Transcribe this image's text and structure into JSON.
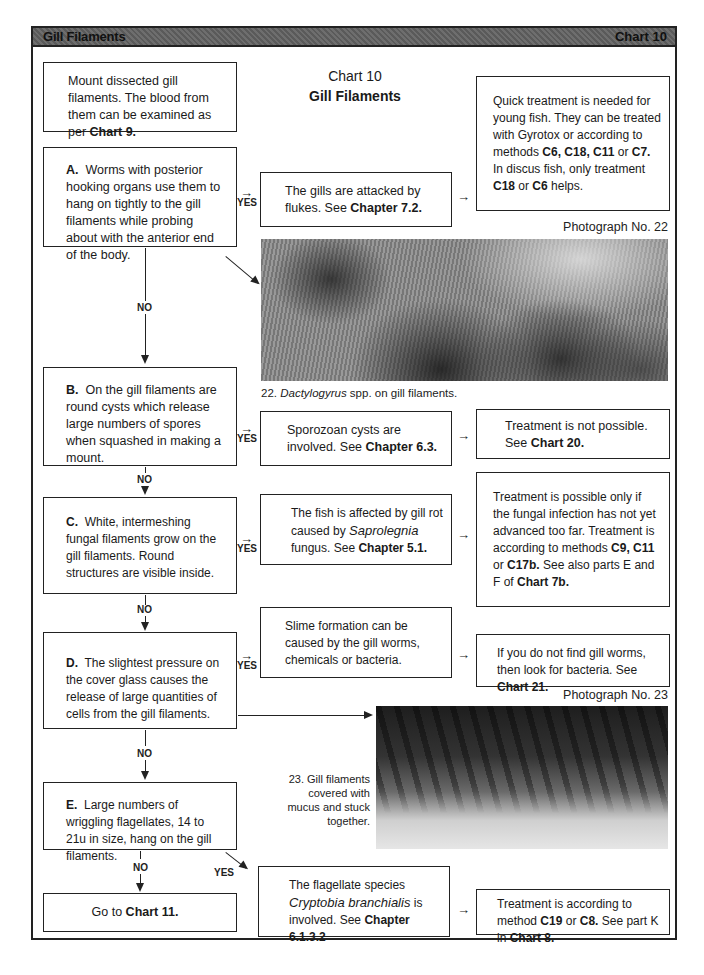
{
  "header": {
    "title": "Gill Filaments",
    "chart_label": "Chart 10"
  },
  "chart_heading": {
    "line1": "Chart 10",
    "line2": "Gill Filaments"
  },
  "intro_box": {
    "text_before": "Mount dissected gill filaments. The blood from them can be examined as per ",
    "ref": "Chart 9."
  },
  "labels": {
    "yes": "YES",
    "no": "NO",
    "arrow": "→"
  },
  "steps": [
    {
      "letter": "A.",
      "question": "Worms with posterior hooking organs use them to hang on tightly to the gill filaments while probing about with the anterior end of the body.",
      "yes_result": {
        "text": "The gills are attacked by flukes. See ",
        "ref": "Chapter 7.2."
      },
      "treatment": {
        "t1": "Quick treatment is needed for young fish. They can be treated with Gyrotox or according to methods ",
        "r1": "C6, C18, C11",
        "t2": " or ",
        "r2": "C7.",
        "t3": " In discus fish, only treatment ",
        "r3": "C18",
        "t4": " or ",
        "r4": "C6",
        "t5": " helps."
      }
    },
    {
      "letter": "B.",
      "question": "On the gill filaments are round cysts which release large numbers of spores when squashed in making a mount.",
      "yes_result": {
        "text": "Sporozoan cysts are involved. See ",
        "ref": "Chapter 6.3."
      },
      "treatment": {
        "t1": "Treatment is not possible. See ",
        "r1": "Chart 20."
      }
    },
    {
      "letter": "C.",
      "question": "White, intermeshing fungal filaments grow on the gill filaments. Round structures are visible inside.",
      "yes_result": {
        "t1": "The fish is affected by gill rot caused by ",
        "italic": "Saprolegnia",
        "t2": " fungus. See ",
        "ref": "Chapter 5.1."
      },
      "treatment": {
        "t1": "Treatment is possible only if the fungal infection has not yet advanced too far. Treatment is according to methods ",
        "r1": "C9, C11",
        "t2": " or ",
        "r2": "C17b.",
        "t3": " See also parts E and F of ",
        "r3": "Chart 7b."
      }
    },
    {
      "letter": "D.",
      "question": "The slightest pressure on the cover glass causes the release of large quantities of cells from the gill filaments.",
      "yes_result": {
        "text": "Slime formation can be caused by the gill worms, chemicals or bacteria."
      },
      "treatment": {
        "t1": "If you do not find gill worms, then look for bacteria. See ",
        "r1": "Chart 21."
      }
    },
    {
      "letter": "E.",
      "question": "Large numbers of wriggling flagellates, 14 to 21u in size, hang on the gill filaments.",
      "yes_result": {
        "t1": "The flagellate species ",
        "italic": "Cryptobia branchialis",
        "t2": " is involved. See ",
        "ref": "Chapter 6.1.3.2"
      },
      "treatment": {
        "r1": "C19",
        "t1": " or ",
        "r2": "C8.",
        "t2": " See part K in ",
        "r3": "Chart 8.",
        "t0": "Treatment is according to method "
      }
    }
  ],
  "final_box": {
    "text": "Go to ",
    "ref": "Chart 11."
  },
  "photos": [
    {
      "label": "Photograph No. 22",
      "caption_num": "22. ",
      "caption_italic": "Dactylogyrus",
      "caption_rest": " spp. on gill filaments."
    },
    {
      "label": "Photograph No. 23",
      "caption": "23. Gill filaments covered with mucus and stuck together."
    }
  ]
}
